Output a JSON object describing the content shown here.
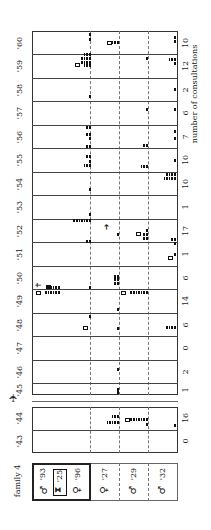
{
  "chart_data": {
    "type": "table",
    "title": "family 4",
    "orientation": "rotated 90° (years run top-to-bottom from '60 to '43)",
    "xlabel": "number of consultations",
    "years": [
      "'43",
      "'44",
      "'45",
      "'46",
      "'47",
      "'48",
      "'49",
      "'50",
      "'51",
      "'52",
      "'53",
      "'54",
      "'55",
      "'56",
      "'57",
      "'58",
      "'59",
      "'60"
    ],
    "consultations": [
      0,
      16,
      1,
      2,
      0,
      6,
      14,
      6,
      1,
      17,
      1,
      10,
      10,
      7,
      6,
      2,
      12,
      10
    ],
    "members": [
      {
        "sex": "male",
        "symbol": "♂",
        "born": "'93",
        "label": "♂'93"
      },
      {
        "sex": "deceased",
        "symbol": "⧗",
        "born": "'25",
        "label": "'25"
      },
      {
        "sex": "female",
        "symbol": "♀",
        "born": "'96",
        "label": "♀'96"
      },
      {
        "sex": "female",
        "symbol": "♀",
        "born": "'27",
        "label": "♀'27"
      },
      {
        "sex": "male",
        "symbol": "♂",
        "born": "'29",
        "label": "♂'29"
      },
      {
        "sex": "male",
        "symbol": "♂",
        "born": "'32",
        "label": "♂'32"
      }
    ],
    "legend_markers": {
      "tick": "single consultation",
      "open_square": "home visit / referral",
      "filled_square": "death",
      "cross": "died",
      "arrow": "moved"
    },
    "grid": "dashed separators between family members",
    "note": "War-break marker (aircraft symbol) between '44 and '45"
  },
  "labels": {
    "family": "family 4",
    "axis": "number of consultations",
    "years": {
      "y60": "'60",
      "y59": "'59",
      "y58": "'58",
      "y57": "'57",
      "y56": "'56",
      "y55": "'55",
      "y54": "'54",
      "y53": "'53",
      "y52": "'52",
      "y51": "'51",
      "y50": "'50",
      "y49": "'49",
      "y48": "'48",
      "y47": "'47",
      "y46": "'46",
      "y45": "'45",
      "y44": "'44",
      "y43": "'43"
    },
    "counts": {
      "y60": "10",
      "y59": "12",
      "y58": "2",
      "y57": "6",
      "y56": "7",
      "y55": "10",
      "y54": "10",
      "y53": "1",
      "y52": "17",
      "y51": "1",
      "y50": "6",
      "y49": "14",
      "y48": "6",
      "y47": "0",
      "y46": "2",
      "y45": "1",
      "y44": "16",
      "y43": "0"
    },
    "members": {
      "m93": "'93",
      "d25": "'25",
      "f96": "'96",
      "f27": "'27",
      "m29": "'29",
      "m32": "'32"
    },
    "symbols": {
      "male": "♂",
      "female": "♀",
      "hourglass": "⧗",
      "plane": "✈",
      "arrow": "➜",
      "cross": "✝"
    }
  }
}
